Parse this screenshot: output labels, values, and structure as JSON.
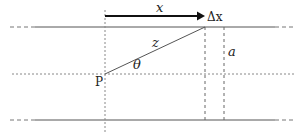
{
  "diagram": {
    "labels": {
      "x": "x",
      "delta_x": "Δx",
      "z": "z",
      "theta": "θ",
      "point": "P",
      "a": "a"
    },
    "colors": {
      "line": "#555555",
      "dotted": "#888888",
      "arrow": "#111111",
      "text": "#222222"
    }
  }
}
